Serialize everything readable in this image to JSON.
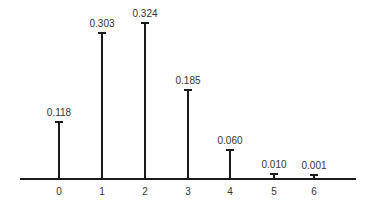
{
  "chart_data": {
    "type": "bar",
    "style": "stem",
    "title": "",
    "xlabel": "",
    "ylabel": "",
    "categories": [
      "0",
      "1",
      "2",
      "3",
      "4",
      "5",
      "6"
    ],
    "values": [
      0.118,
      0.303,
      0.324,
      0.185,
      0.06,
      0.01,
      0.001
    ],
    "value_labels": [
      "0.118",
      "0.303",
      "0.324",
      "0.185",
      "0.060",
      "0.010",
      "0.001"
    ],
    "ylim": [
      0,
      0.34
    ],
    "grid": false,
    "legend": null
  },
  "layout": {
    "axis_y": 178,
    "axis_x0": 20,
    "axis_x1": 356,
    "px_per_unit": 481,
    "bar_x": [
      59,
      102,
      145,
      188,
      230,
      274,
      314
    ]
  }
}
